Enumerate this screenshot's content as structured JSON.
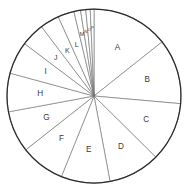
{
  "figure": {
    "background_color": "#ffffff",
    "outline_color": "#2b2b2b",
    "divider_color": "#6b6b6b",
    "label_color": "#3a3a3a"
  },
  "chart_data": {
    "type": "pie",
    "title": "",
    "start_angle_deg": 0,
    "direction": "clockwise",
    "center": {
      "x": 94,
      "y": 96
    },
    "radius": 87,
    "categories": [
      "A",
      "B",
      "C",
      "D",
      "E",
      "F",
      "G",
      "H",
      "I",
      "J",
      "K",
      "L",
      "M",
      "N",
      "O",
      "P"
    ],
    "values": [
      52,
      44,
      40,
      35,
      33,
      30,
      28,
      26,
      22,
      16,
      13,
      11,
      4.5,
      3.5,
      3,
      2.5
    ],
    "labels": [
      "A",
      "B",
      "C",
      "D",
      "E",
      "F",
      "G",
      "H",
      "I",
      "J",
      "K",
      "L",
      "M",
      "N",
      "O",
      "P"
    ],
    "label_sizes": [
      "lg",
      "lg",
      "lg",
      "lg",
      "lg",
      "lg",
      "lg",
      "lg",
      "lg",
      "md",
      "md",
      "md",
      "sm",
      "xs",
      "xs",
      "xs"
    ],
    "label_radius_fraction": [
      0.62,
      0.64,
      0.66,
      0.66,
      0.62,
      0.62,
      0.6,
      0.62,
      0.62,
      0.62,
      0.6,
      0.62,
      0.72,
      0.74,
      0.76,
      0.78
    ],
    "xlabel": "",
    "ylabel": "",
    "legend": "none",
    "grid": false
  }
}
